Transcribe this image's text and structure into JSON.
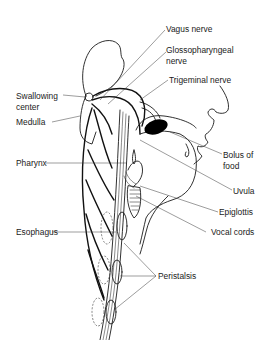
{
  "figure": {
    "labels": {
      "vagus": "Vagus nerve",
      "glosso_1": "Glossopharyngeal",
      "glosso_2": "nerve",
      "trigeminal": "Trigeminal nerve",
      "swallowing_1": "Swallowing",
      "swallowing_2": "center",
      "medulla": "Medulla",
      "bolus_1": "Bolus of",
      "bolus_2": "food",
      "pharynx": "Pharynx",
      "uvula": "Uvula",
      "epiglottis": "Epiglottis",
      "vocal_cords": "Vocal cords",
      "esophagus": "Esophagus",
      "peristalsis": "Peristalsis"
    },
    "colors": {
      "line": "#1a1a1a",
      "bolus_fill": "#000000",
      "background": "#ffffff"
    }
  }
}
